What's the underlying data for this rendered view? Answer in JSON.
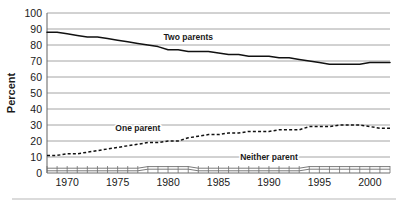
{
  "chart_data": {
    "type": "line",
    "title": "",
    "subtitle": "",
    "xlabel": "",
    "ylabel": "Percent",
    "xlim": [
      1968,
      2002
    ],
    "ylim": [
      0,
      100
    ],
    "ytick_labels": [
      "0",
      "10",
      "20",
      "30",
      "40",
      "50",
      "60",
      "70",
      "80",
      "90",
      "100"
    ],
    "ytick_values": [
      0,
      10,
      20,
      30,
      40,
      50,
      60,
      70,
      80,
      90,
      100
    ],
    "xtick_labels": [
      "1970",
      "1975",
      "1980",
      "1985",
      "1990",
      "1995",
      "2000"
    ],
    "xtick_values": [
      1970,
      1975,
      1980,
      1985,
      1990,
      1995,
      2000
    ],
    "minor_xticks_annual": true,
    "grid": "horizontal",
    "legend": "inline-labels",
    "x": [
      1968,
      1969,
      1970,
      1971,
      1972,
      1973,
      1974,
      1975,
      1976,
      1977,
      1978,
      1979,
      1980,
      1981,
      1982,
      1983,
      1984,
      1985,
      1986,
      1987,
      1988,
      1989,
      1990,
      1991,
      1992,
      1993,
      1994,
      1995,
      1996,
      1997,
      1998,
      1999,
      2000,
      2001,
      2002
    ],
    "series": [
      {
        "name": "Two parents",
        "style": "solid",
        "label_x": 1982,
        "label_y": 83,
        "values": [
          88,
          88,
          87,
          86,
          85,
          85,
          84,
          83,
          82,
          81,
          80,
          79,
          77,
          77,
          76,
          76,
          76,
          75,
          74,
          74,
          73,
          73,
          73,
          72,
          72,
          71,
          70,
          69,
          68,
          68,
          68,
          68,
          69,
          69,
          69
        ]
      },
      {
        "name": "One parent",
        "style": "dashed",
        "label_x": 1977,
        "label_y": 26,
        "values": [
          11,
          11,
          12,
          12,
          13,
          14,
          15,
          16,
          17,
          18,
          19,
          19,
          20,
          20,
          22,
          23,
          24,
          24,
          25,
          25,
          26,
          26,
          26,
          27,
          27,
          27,
          29,
          29,
          29,
          30,
          30,
          30,
          29,
          28,
          28
        ]
      },
      {
        "name": "Neither parent",
        "style": "thin",
        "label_x": 1990,
        "label_y": 8,
        "values": [
          3,
          3,
          3,
          3,
          3,
          3,
          3,
          3,
          3,
          3,
          4,
          4,
          4,
          4,
          4,
          3,
          3,
          3,
          3,
          3,
          3,
          3,
          3,
          3,
          3,
          3,
          4,
          4,
          4,
          4,
          4,
          4,
          4,
          4,
          4
        ]
      }
    ]
  },
  "colors": {
    "series_line": "#111111",
    "gridline": "#9a9a9a",
    "axis": "#6f6f6f",
    "text": "#1a1a1a",
    "background": "#ffffff",
    "footer_rule": "#b8b8b8"
  }
}
